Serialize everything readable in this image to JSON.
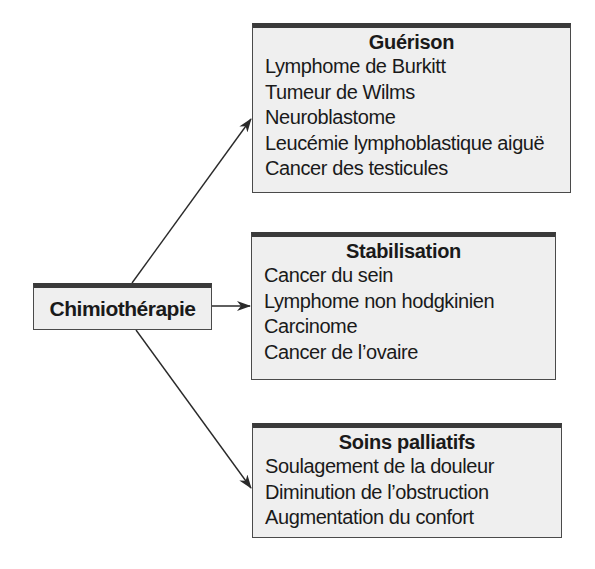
{
  "diagram": {
    "center": {
      "label": "Chimiothérapie"
    },
    "branches": [
      {
        "title": "Guérison",
        "items": [
          "Lymphome de Burkitt",
          "Tumeur de Wilms",
          "Neuroblastome",
          "Leucémie lymphoblastique aiguë",
          "Cancer des testicules"
        ]
      },
      {
        "title": "Stabilisation",
        "items": [
          "Cancer du sein",
          "Lymphome non hodgkinien",
          "Carcinome",
          "Cancer de l’ovaire"
        ]
      },
      {
        "title": "Soins palliatifs",
        "items": [
          "Soulagement de la douleur",
          "Diminution de l’obstruction",
          "Augmentation du confort"
        ]
      }
    ],
    "colors": {
      "box_fill": "#efefef",
      "box_border": "#4a4a4a",
      "box_top_bar": "#3a3a3a",
      "arrow": "#2a2a2a"
    }
  }
}
